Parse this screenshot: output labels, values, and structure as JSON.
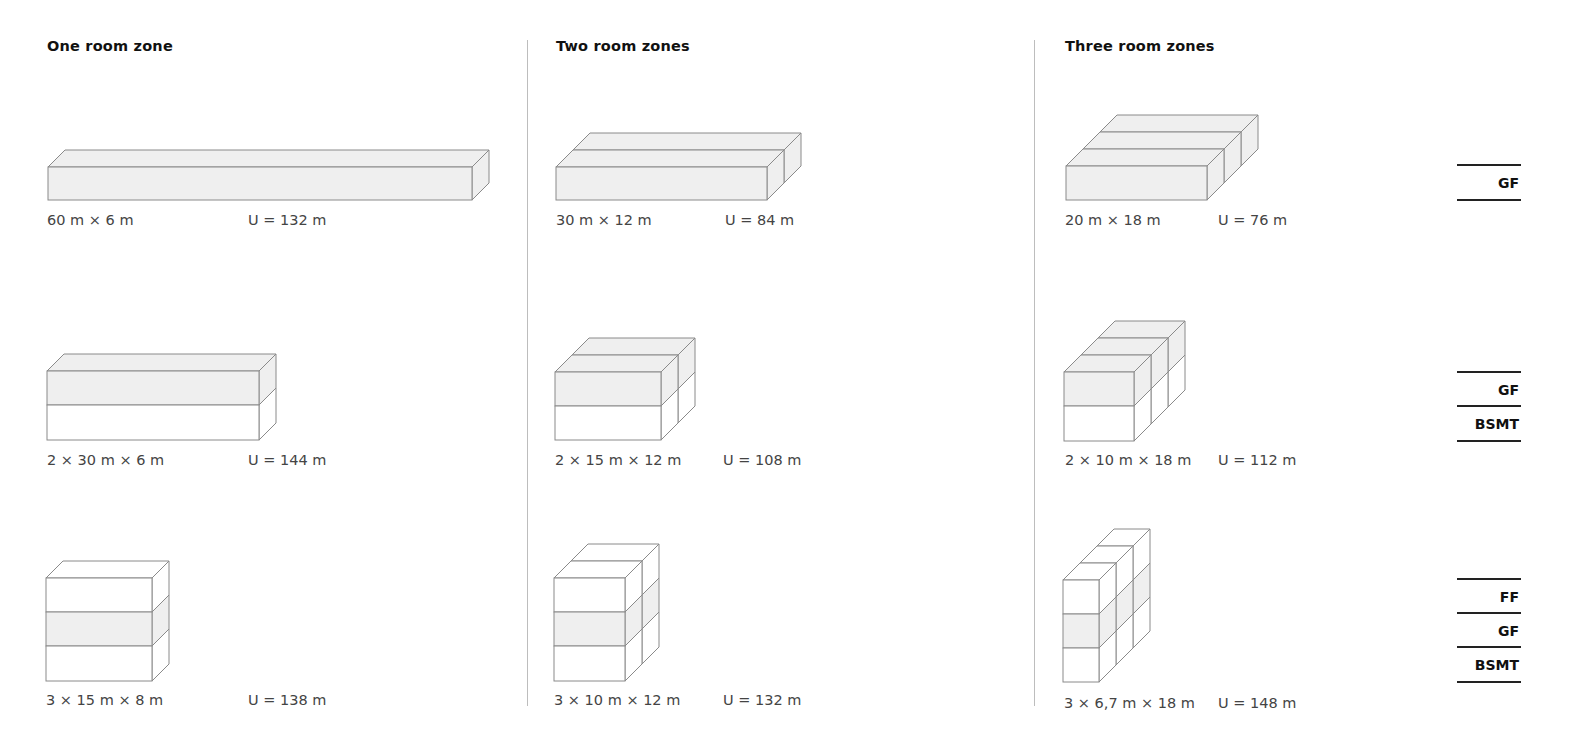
{
  "columns": [
    {
      "title": "One room zone",
      "x": 47
    },
    {
      "title": "Two room zones",
      "x": 556
    },
    {
      "title": "Three room zones",
      "x": 1065
    }
  ],
  "dividers": [
    {
      "x": 527,
      "top": 40,
      "bottom": 706
    },
    {
      "x": 1034,
      "top": 40,
      "bottom": 706
    }
  ],
  "colors": {
    "stroke": "#8a8a8a",
    "fill_gf": "#efefef",
    "fill_other": "#ffffff",
    "legend_line": "#222222"
  },
  "variants": [
    {
      "id": "r1c1",
      "dims": "60 m × 6 m",
      "perimeter": "U = 132 m",
      "dims_xy": [
        47,
        212
      ],
      "u_xy": [
        248,
        212
      ],
      "box": {
        "x": 48,
        "y": 167,
        "w": 424,
        "floors": [
          {
            "h": 33,
            "gf": true
          }
        ],
        "zones": 1,
        "dx": 17,
        "dy": 17
      }
    },
    {
      "id": "r1c2",
      "dims": "30 m × 12 m",
      "perimeter": "U = 84 m",
      "dims_xy": [
        556,
        212
      ],
      "u_xy": [
        725,
        212
      ],
      "box": {
        "x": 556,
        "y": 167,
        "w": 211,
        "floors": [
          {
            "h": 33,
            "gf": true
          }
        ],
        "zones": 2,
        "dx": 17,
        "dy": 17
      }
    },
    {
      "id": "r1c3",
      "dims": "20 m × 18 m",
      "perimeter": "U = 76 m",
      "dims_xy": [
        1065,
        212
      ],
      "u_xy": [
        1218,
        212
      ],
      "box": {
        "x": 1066,
        "y": 166,
        "w": 141,
        "floors": [
          {
            "h": 34,
            "gf": true
          }
        ],
        "zones": 3,
        "dx": 17,
        "dy": 17
      }
    },
    {
      "id": "r2c1",
      "dims": "2 × 30 m × 6 m",
      "perimeter": "U = 144 m",
      "dims_xy": [
        47,
        452
      ],
      "u_xy": [
        248,
        452
      ],
      "box": {
        "x": 47,
        "y": 371,
        "w": 212,
        "floors": [
          {
            "h": 34,
            "gf": true
          },
          {
            "h": 35,
            "gf": false
          }
        ],
        "zones": 1,
        "dx": 17,
        "dy": 17
      }
    },
    {
      "id": "r2c2",
      "dims": "2 × 15 m × 12 m",
      "perimeter": "U = 108 m",
      "dims_xy": [
        555,
        452
      ],
      "u_xy": [
        723,
        452
      ],
      "box": {
        "x": 555,
        "y": 372,
        "w": 106,
        "floors": [
          {
            "h": 34,
            "gf": true
          },
          {
            "h": 34,
            "gf": false
          }
        ],
        "zones": 2,
        "dx": 17,
        "dy": 17
      }
    },
    {
      "id": "r2c3",
      "dims": "2 × 10 m × 18 m",
      "perimeter": "U = 112 m",
      "dims_xy": [
        1065,
        452
      ],
      "u_xy": [
        1218,
        452
      ],
      "box": {
        "x": 1064,
        "y": 372,
        "w": 70,
        "floors": [
          {
            "h": 34,
            "gf": true
          },
          {
            "h": 35,
            "gf": false
          }
        ],
        "zones": 3,
        "dx": 17,
        "dy": 17
      }
    },
    {
      "id": "r3c1",
      "dims": "3 × 15 m × 8 m",
      "perimeter": "U = 138 m",
      "dims_xy": [
        46,
        692
      ],
      "u_xy": [
        248,
        692
      ],
      "box": {
        "x": 46,
        "y": 578,
        "w": 106,
        "floors": [
          {
            "h": 34,
            "gf": false
          },
          {
            "h": 34,
            "gf": true
          },
          {
            "h": 35,
            "gf": false
          }
        ],
        "zones": 1,
        "dx": 17,
        "dy": 17
      }
    },
    {
      "id": "r3c2",
      "dims": "3 × 10 m × 12 m",
      "perimeter": "U = 132 m",
      "dims_xy": [
        554,
        692
      ],
      "u_xy": [
        723,
        692
      ],
      "box": {
        "x": 554,
        "y": 578,
        "w": 71,
        "floors": [
          {
            "h": 34,
            "gf": false
          },
          {
            "h": 34,
            "gf": true
          },
          {
            "h": 35,
            "gf": false
          }
        ],
        "zones": 2,
        "dx": 17,
        "dy": 17
      }
    },
    {
      "id": "r3c3",
      "dims": "3 × 6,7 m × 18 m",
      "perimeter": "U = 148 m",
      "dims_xy": [
        1064,
        695
      ],
      "u_xy": [
        1218,
        695
      ],
      "box": {
        "x": 1063,
        "y": 580,
        "w": 36,
        "floors": [
          {
            "h": 34,
            "gf": false
          },
          {
            "h": 34,
            "gf": true
          },
          {
            "h": 34,
            "gf": false
          }
        ],
        "zones": 3,
        "dx": 17,
        "dy": 17
      }
    }
  ],
  "legends": [
    {
      "lines_y": [
        164,
        199
      ],
      "labels": [
        {
          "text": "GF",
          "y": 175
        }
      ]
    },
    {
      "lines_y": [
        371,
        405,
        440
      ],
      "labels": [
        {
          "text": "GF",
          "y": 382
        },
        {
          "text": "BSMT",
          "y": 416
        }
      ]
    },
    {
      "lines_y": [
        578,
        612,
        646,
        681
      ],
      "labels": [
        {
          "text": "FF",
          "y": 589
        },
        {
          "text": "GF",
          "y": 623
        },
        {
          "text": "BSMT",
          "y": 657
        }
      ]
    }
  ],
  "legend_x": 1457,
  "legend_w": 64
}
